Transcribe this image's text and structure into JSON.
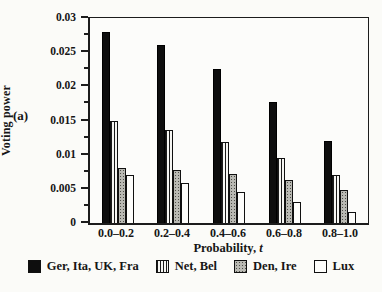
{
  "figure_label": "(a)",
  "chart_data": {
    "type": "bar",
    "title": "",
    "xlabel_text": "Probability,",
    "xlabel_var": "t",
    "ylabel": "Voting power",
    "categories": [
      "0.0–0.2",
      "0.2–0.4",
      "0.4–0.6",
      "0.6–0.8",
      "0.8–1.0"
    ],
    "series": [
      {
        "name": "Ger, Ita, UK, Fra",
        "pattern": "solid-black",
        "values": [
          0.028,
          0.026,
          0.0225,
          0.0177,
          0.012
        ]
      },
      {
        "name": "Net, Bel",
        "pattern": "vertical-stripes",
        "values": [
          0.015,
          0.0136,
          0.0118,
          0.0095,
          0.007
        ]
      },
      {
        "name": "Den, Ire",
        "pattern": "gray-stipple",
        "values": [
          0.008,
          0.0078,
          0.0072,
          0.0063,
          0.0048
        ]
      },
      {
        "name": "Lux",
        "pattern": "white-outline",
        "values": [
          0.007,
          0.0058,
          0.0045,
          0.0031,
          0.0016
        ]
      }
    ],
    "ylim": [
      0,
      0.03
    ],
    "ytick_major_step": 0.005,
    "ytick_minor_step": 0.0025,
    "ytick_labels": [
      "0",
      "0.005",
      "0.01",
      "0.015",
      "0.02",
      "0.025",
      "0.03"
    ],
    "legend_position": "bottom",
    "grid": false
  },
  "colors": {
    "background": "#fbfbf8",
    "axis": "#1c1c1c",
    "bar_black": "#0e0e0e",
    "bar_gray": "#b9b9b3",
    "bar_white": "#fdfdfb",
    "text": "#161616"
  }
}
